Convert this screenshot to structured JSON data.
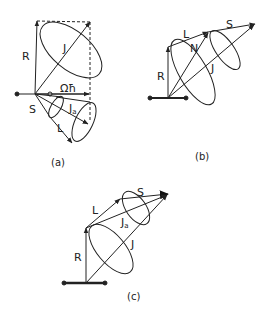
{
  "figure": {
    "panels": [
      {
        "id": "a",
        "caption": "(a)",
        "labels": {
          "R": "R",
          "J": "J",
          "Omega_hbar": "Ωħ",
          "S": "S",
          "Ja": "J",
          "Ja_sub": "a",
          "L": "L"
        }
      },
      {
        "id": "b",
        "caption": "(b)",
        "labels": {
          "R": "R",
          "L": "L",
          "N": "N",
          "S": "S",
          "J": "J"
        }
      },
      {
        "id": "c",
        "caption": "(c)",
        "labels": {
          "R": "R",
          "L": "L",
          "S": "S",
          "Ja": "J",
          "Ja_sub": "a",
          "J": "J"
        }
      }
    ]
  }
}
